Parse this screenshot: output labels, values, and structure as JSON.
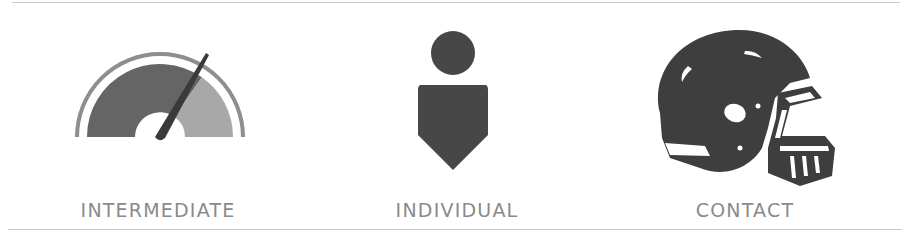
{
  "features": [
    {
      "label": "INTERMEDIATE",
      "icon": "gauge-icon"
    },
    {
      "label": "INDIVIDUAL",
      "icon": "person-icon"
    },
    {
      "label": "CONTACT",
      "icon": "football-helmet-icon"
    }
  ],
  "colors": {
    "icon_dark": "#474747",
    "icon_mid": "#656565",
    "icon_light": "#a4a4a4",
    "label": "#8a8a8a",
    "divider": "#c8c8c8"
  }
}
